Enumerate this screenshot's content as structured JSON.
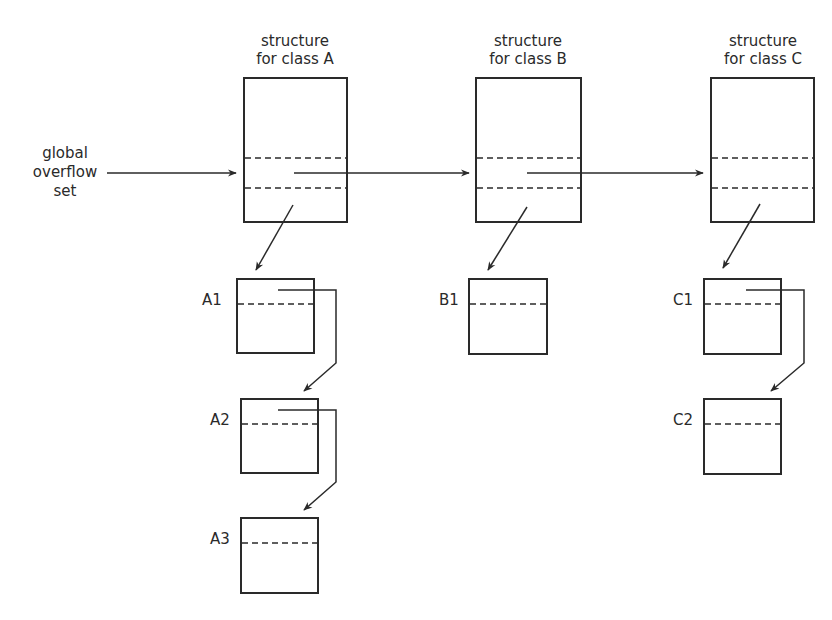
{
  "diagram": {
    "input_label": [
      "global",
      "overflow",
      "set"
    ],
    "class_structures": [
      {
        "id": "A",
        "title": [
          "structure",
          "for class A"
        ],
        "x": 244,
        "y": 78,
        "w": 103,
        "h": 144,
        "dash1": 158,
        "dash2": 188
      },
      {
        "id": "B",
        "title": [
          "structure",
          "for class B"
        ],
        "x": 476,
        "y": 78,
        "w": 105,
        "h": 144,
        "dash1": 158,
        "dash2": 188
      },
      {
        "id": "C",
        "title": [
          "structure",
          "for class C"
        ],
        "x": 711,
        "y": 78,
        "w": 103,
        "h": 144,
        "dash1": 158,
        "dash2": 188
      }
    ],
    "nodes": [
      {
        "label": "A1",
        "x": 237,
        "y": 279,
        "w": 77,
        "h": 74,
        "dash": 304
      },
      {
        "label": "A2",
        "x": 241,
        "y": 399,
        "w": 77,
        "h": 74,
        "dash": 424
      },
      {
        "label": "A3",
        "x": 241,
        "y": 518,
        "w": 77,
        "h": 75,
        "dash": 543
      },
      {
        "label": "B1",
        "x": 469,
        "y": 279,
        "w": 78,
        "h": 75,
        "dash": 304
      },
      {
        "label": "C1",
        "x": 704,
        "y": 279,
        "w": 77,
        "h": 75,
        "dash": 304
      },
      {
        "label": "C2",
        "x": 704,
        "y": 399,
        "w": 77,
        "h": 75,
        "dash": 424
      }
    ],
    "edges": [
      {
        "from": "global overflow set",
        "to": "A"
      },
      {
        "from": "A",
        "to": "B"
      },
      {
        "from": "B",
        "to": "C"
      },
      {
        "from": "A",
        "to": "A1"
      },
      {
        "from": "A1",
        "to": "A2"
      },
      {
        "from": "A2",
        "to": "A3"
      },
      {
        "from": "B",
        "to": "B1"
      },
      {
        "from": "C",
        "to": "C1"
      },
      {
        "from": "C1",
        "to": "C2"
      }
    ],
    "colors": {
      "stroke": "#2a2a2a",
      "background": "#ffffff"
    }
  }
}
